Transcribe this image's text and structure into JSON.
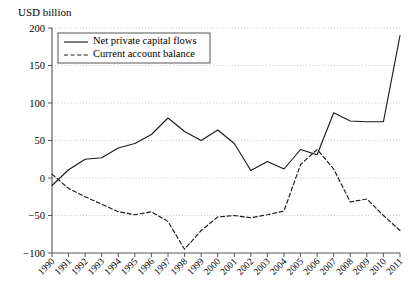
{
  "chart_data": {
    "type": "line",
    "title": "",
    "ylabel": "USD billion",
    "xlabel": "",
    "ylim": [
      -100,
      200
    ],
    "yticks": [
      -100,
      -50,
      0,
      50,
      100,
      150,
      200
    ],
    "ytick_labels": [
      "−100",
      "−50",
      "0",
      "50",
      "100",
      "150",
      "200"
    ],
    "grid": true,
    "grid_style": "dotted-horizontal",
    "legend_position": "top-left-inside",
    "categories": [
      "1990",
      "1991",
      "1992",
      "1993",
      "1994",
      "1995",
      "1996",
      "1997",
      "1998",
      "1999",
      "2000",
      "2001",
      "2002",
      "2003",
      "2004",
      "2005",
      "2006",
      "2007",
      "2008",
      "2009",
      "2010",
      "2011"
    ],
    "series": [
      {
        "name": "Net private capital flows",
        "style": "solid",
        "color": "#1a1a1a",
        "values": [
          -10,
          11,
          25,
          27,
          40,
          46,
          58,
          80,
          62,
          50,
          64,
          46,
          10,
          22,
          12,
          38,
          31,
          87,
          76,
          75,
          75,
          190
        ]
      },
      {
        "name": "Current account balance",
        "style": "dashed",
        "color": "#1a1a1a",
        "values": [
          5,
          -14,
          -25,
          -35,
          -45,
          -49,
          -45,
          -58,
          -95,
          -70,
          -52,
          -50,
          -53,
          -49,
          -44,
          18,
          38,
          12,
          -32,
          -28,
          -50,
          -70
        ]
      }
    ]
  },
  "legend": {
    "items": [
      {
        "label": "Net private capital flows",
        "style": "solid"
      },
      {
        "label": "Current account balance",
        "style": "dashed"
      }
    ]
  },
  "colors": {
    "line": "#1a1a1a",
    "grid": "#b9b9b9",
    "axis": "#555555",
    "background": "#ffffff"
  }
}
